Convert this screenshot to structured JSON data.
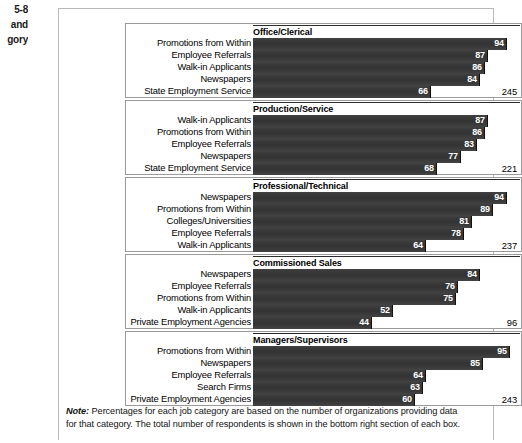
{
  "margin_caption": {
    "lines": [
      "5-8",
      "and",
      "gory"
    ]
  },
  "footnote": {
    "label": "Note:",
    "text": " Percentages for each job category are based on the number of organizations providing data for that category. The total number of respondents is shown in the bottom right section of each box."
  },
  "colors": {
    "bar": "#3a3a3a",
    "bar_value_text": "#ffffff",
    "panel_border": "#9a9a9a",
    "figure_border": "#b9b9b9",
    "title_rule": "#2b2b2b"
  },
  "axis": {
    "max": 100,
    "units": "percent"
  },
  "chart_data": {
    "type": "bar",
    "orientation": "horizontal",
    "title": "",
    "xlabel": "",
    "ylabel": "",
    "xlim": [
      0,
      100
    ],
    "grid": false,
    "legend": "none",
    "value_labels": true,
    "panels": [
      {
        "title": "Office/Clerical",
        "total_respondents": "245",
        "categories": [
          "Promotions from Within",
          "Employee Referrals",
          "Walk-in Applicants",
          "Newspapers",
          "State Employment Service"
        ],
        "values": [
          94,
          87,
          86,
          84,
          66
        ]
      },
      {
        "title": "Production/Service",
        "total_respondents": "221",
        "categories": [
          "Walk-in Applicants",
          "Promotions from Within",
          "Employee Referrals",
          "Newspapers",
          "State Employment Service"
        ],
        "values": [
          87,
          86,
          83,
          77,
          68
        ]
      },
      {
        "title": "Professional/Technical",
        "total_respondents": "237",
        "categories": [
          "Newspapers",
          "Promotions from Within",
          "Colleges/Universities",
          "Employee Referrals",
          "Walk-in Applicants"
        ],
        "values": [
          94,
          89,
          81,
          78,
          64
        ]
      },
      {
        "title": "Commissioned Sales",
        "total_respondents": "96",
        "categories": [
          "Newspapers",
          "Employee Referrals",
          "Promotions from Within",
          "Walk-in Applicants",
          "Private Employment Agencies"
        ],
        "values": [
          84,
          76,
          75,
          52,
          44
        ]
      },
      {
        "title": "Managers/Supervisors",
        "total_respondents": "243",
        "categories": [
          "Promotions from Within",
          "Newspapers",
          "Employee Referrals",
          "Search Firms",
          "Private Employment Agencies"
        ],
        "values": [
          95,
          85,
          64,
          63,
          60
        ]
      }
    ]
  }
}
